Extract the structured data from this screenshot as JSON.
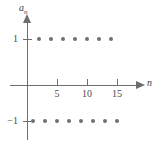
{
  "figure": {
    "name": "alternating-sequence-plot",
    "axes": {
      "x": {
        "label": "n",
        "ticks": [
          5,
          10,
          15
        ],
        "tick_labels": [
          "5",
          "10",
          "15"
        ],
        "range": [
          0,
          17.5
        ],
        "origin_px": 27,
        "unit_px": 6
      },
      "y": {
        "label": "a",
        "label_sub": "n",
        "ticks": [
          1,
          -1
        ],
        "tick_labels": [
          "1",
          "−1"
        ],
        "range": [
          -1.45,
          1.45
        ]
      }
    },
    "colors": {
      "axis": "#6e6e6e",
      "point": "#707070",
      "text": "#3d3d3d",
      "background": "#ffffff"
    }
  },
  "chart_data": {
    "type": "scatter",
    "title": "",
    "xlabel": "n",
    "ylabel": "a_n",
    "xlim": [
      0,
      17.5
    ],
    "ylim": [
      -1.45,
      1.45
    ],
    "grid": false,
    "legend": null,
    "xticks": [
      5,
      10,
      15
    ],
    "yticks": [
      -1,
      1
    ],
    "series": [
      {
        "name": "a_n = (-1)^n",
        "x": [
          1,
          2,
          3,
          4,
          5,
          6,
          7,
          8,
          9,
          10,
          11,
          12,
          13,
          14,
          15
        ],
        "y": [
          -1,
          1,
          -1,
          1,
          -1,
          1,
          -1,
          1,
          -1,
          1,
          -1,
          1,
          -1,
          1,
          -1
        ]
      }
    ]
  }
}
